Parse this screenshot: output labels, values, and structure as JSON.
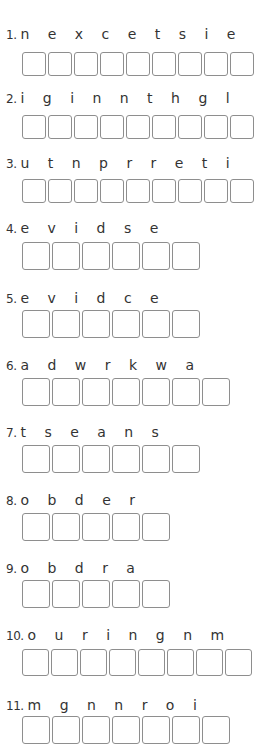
{
  "questions": [
    {
      "number": "1.",
      "letters": "n e x c e t s i e",
      "boxes": 9
    },
    {
      "number": "2.",
      "letters": "i g i n n t h g l",
      "boxes": 9
    },
    {
      "number": "3.",
      "letters": "u t n p r r e t i",
      "boxes": 9
    },
    {
      "number": "4.",
      "letters": "e v i d s e",
      "boxes": 6
    },
    {
      "number": "5.",
      "letters": "e v i d c e",
      "boxes": 6
    },
    {
      "number": "6.",
      "letters": "a d w r k w a",
      "boxes": 7
    },
    {
      "number": "7.",
      "letters": "t s e a n s",
      "boxes": 6
    },
    {
      "number": "8.",
      "letters": "o b d e r",
      "boxes": 5
    },
    {
      "number": "9.",
      "letters": "o b d r a",
      "boxes": 5
    },
    {
      "number": "10.",
      "letters": "o u r i n g n m",
      "boxes": 8
    },
    {
      "number": "11.",
      "letters": "m g n n r o i",
      "boxes": 7
    }
  ],
  "colors": {
    "box_border": "#8e8e8e",
    "text": "#333333"
  }
}
